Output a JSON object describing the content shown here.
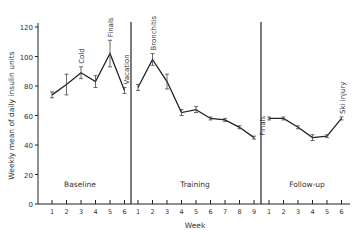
{
  "chart_data": {
    "type": "line",
    "title": "",
    "xlabel": "Week",
    "ylabel": "Weekly mean of daily insulin units",
    "ylim": [
      0,
      120
    ],
    "yticks": [
      0,
      20,
      40,
      60,
      80,
      100,
      120
    ],
    "grid": false,
    "legend": null,
    "phases": [
      {
        "name": "Baseline",
        "weeks": [
          1,
          2,
          3,
          4,
          5,
          6
        ],
        "values": [
          74,
          81,
          89,
          83,
          102,
          77
        ],
        "err": [
          2,
          7,
          4,
          4,
          9,
          2
        ],
        "annotations": [
          {
            "week": 3,
            "label": "Cold"
          },
          {
            "week": 5,
            "label": "Finals"
          },
          {
            "week": 6,
            "label": "Vacation"
          }
        ]
      },
      {
        "name": "Training",
        "weeks": [
          1,
          2,
          3,
          4,
          5,
          6,
          7,
          8,
          9
        ],
        "values": [
          79,
          98,
          83,
          62,
          64,
          58,
          57,
          52,
          45
        ],
        "err": [
          2,
          4,
          5,
          2,
          2,
          1,
          1,
          1,
          1
        ],
        "annotations": [
          {
            "week": 2,
            "label": "Bronchitis"
          },
          {
            "week": 9,
            "label": "Finals"
          }
        ]
      },
      {
        "name": "Follow-up",
        "weeks": [
          1,
          2,
          3,
          4,
          5,
          6
        ],
        "values": [
          58,
          58,
          52,
          45,
          46,
          58
        ],
        "err": [
          1,
          1,
          1,
          2,
          1,
          1
        ],
        "annotations": [
          {
            "week": 6,
            "label": "Ski injury"
          }
        ]
      }
    ]
  }
}
